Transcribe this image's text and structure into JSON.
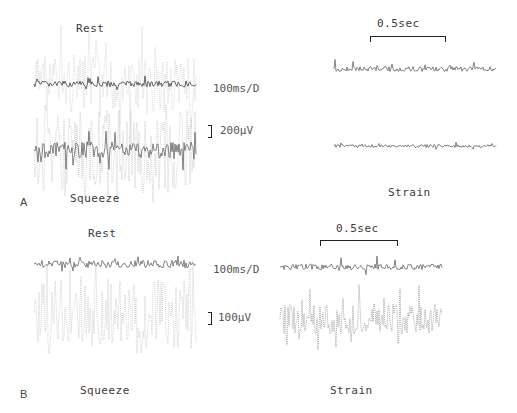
{
  "figure": {
    "panels": [
      {
        "letter": "A",
        "left_top_label": "Rest",
        "left_bottom_label": "Squeeze",
        "right_bottom_label": "Strain",
        "timebase": "100ms/D",
        "amplitude_scale": "200µV",
        "time_scale": "0.5sec"
      },
      {
        "letter": "B",
        "left_top_label": "Rest",
        "left_bottom_label": "Squeeze",
        "right_bottom_label": "Strain",
        "timebase": "100ms/D",
        "amplitude_scale": "100µV",
        "time_scale": "0.5sec"
      }
    ]
  }
}
